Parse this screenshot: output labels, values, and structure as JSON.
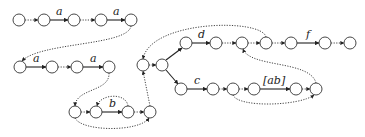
{
  "diagram": {
    "type": "automaton",
    "node_radius": 6,
    "nodes": [
      {
        "id": "n1",
        "x": 19,
        "y": 20
      },
      {
        "id": "n2",
        "x": 44,
        "y": 20
      },
      {
        "id": "n3",
        "x": 74,
        "y": 20
      },
      {
        "id": "n4",
        "x": 101,
        "y": 20
      },
      {
        "id": "n5",
        "x": 131,
        "y": 20
      },
      {
        "id": "n6",
        "x": 20,
        "y": 67
      },
      {
        "id": "n7",
        "x": 52,
        "y": 67
      },
      {
        "id": "n8",
        "x": 77,
        "y": 67
      },
      {
        "id": "n9",
        "x": 109,
        "y": 67
      },
      {
        "id": "n10",
        "x": 75,
        "y": 112
      },
      {
        "id": "n11",
        "x": 96,
        "y": 112
      },
      {
        "id": "n12",
        "x": 128,
        "y": 112
      },
      {
        "id": "n13",
        "x": 150,
        "y": 112
      },
      {
        "id": "n14",
        "x": 143,
        "y": 65
      },
      {
        "id": "n15",
        "x": 162,
        "y": 65
      },
      {
        "id": "n16",
        "x": 186,
        "y": 43
      },
      {
        "id": "n17",
        "x": 216,
        "y": 43
      },
      {
        "id": "n18",
        "x": 242,
        "y": 43
      },
      {
        "id": "n19",
        "x": 266,
        "y": 43
      },
      {
        "id": "n20",
        "x": 291,
        "y": 43
      },
      {
        "id": "n21",
        "x": 325,
        "y": 43
      },
      {
        "id": "n22",
        "x": 350,
        "y": 43
      },
      {
        "id": "n23",
        "x": 181,
        "y": 89
      },
      {
        "id": "n24",
        "x": 213,
        "y": 89
      },
      {
        "id": "n25",
        "x": 233,
        "y": 89
      },
      {
        "id": "n26",
        "x": 254,
        "y": 89
      },
      {
        "id": "n27",
        "x": 296,
        "y": 89
      },
      {
        "id": "n28",
        "x": 316,
        "y": 89
      }
    ],
    "labels": [
      {
        "text": "a",
        "x": 59,
        "y": 14
      },
      {
        "text": "a",
        "x": 116,
        "y": 14
      },
      {
        "text": "a",
        "x": 36,
        "y": 61
      },
      {
        "text": "a",
        "x": 93,
        "y": 61
      },
      {
        "text": "b",
        "x": 112,
        "y": 106
      },
      {
        "text": "d",
        "x": 201,
        "y": 37
      },
      {
        "text": "f",
        "x": 308,
        "y": 37
      },
      {
        "text": "c",
        "x": 197,
        "y": 83
      },
      {
        "text": "[ab]",
        "x": 275,
        "y": 83
      }
    ]
  }
}
